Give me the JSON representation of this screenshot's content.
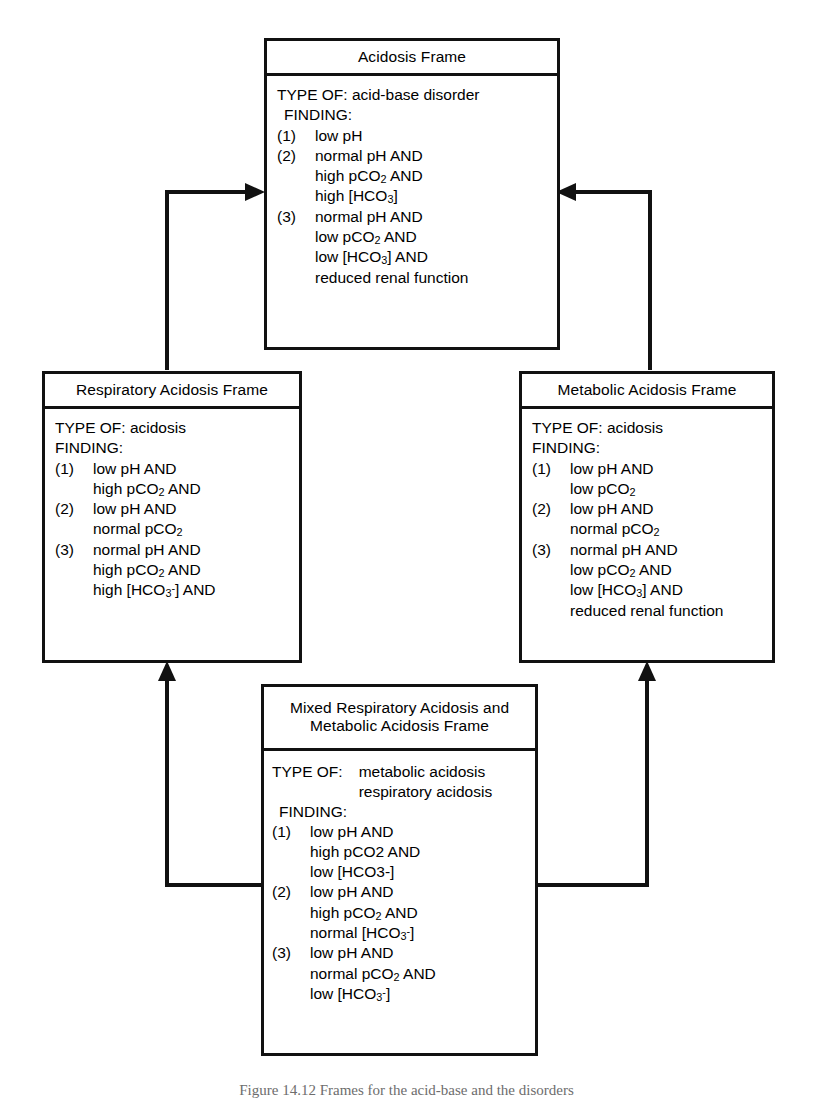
{
  "figure": {
    "caption": "Figure 14.12  Frames for the acid-base and the disorders"
  },
  "frames": {
    "acidosis": {
      "title": "Acidosis Frame",
      "type_of_label": "TYPE OF:",
      "type_of_value": "acid-base disorder",
      "finding_label": "FINDING:",
      "findings": [
        {
          "num": "(1)",
          "lines": [
            "low pH"
          ]
        },
        {
          "num": "(2)",
          "lines": [
            "normal pH AND",
            "high pCO₂ AND",
            "high [HCO₃]"
          ]
        },
        {
          "num": "(3)",
          "lines": [
            "normal pH AND",
            "low pCO₂ AND",
            "low [HCO₃] AND",
            "reduced renal function"
          ]
        }
      ]
    },
    "respiratory": {
      "title": "Respiratory Acidosis Frame",
      "type_of_label": "TYPE OF:",
      "type_of_value": "acidosis",
      "finding_label": "FINDING:",
      "findings": [
        {
          "num": "(1)",
          "lines": [
            "low pH AND",
            "high pCO₂ AND"
          ]
        },
        {
          "num": "(2)",
          "lines": [
            "low pH AND",
            "normal pCO₂"
          ]
        },
        {
          "num": "(3)",
          "lines": [
            "normal pH AND",
            "high pCO₂ AND",
            "high [HCO₃⁻] AND"
          ]
        }
      ]
    },
    "metabolic": {
      "title": "Metabolic Acidosis Frame",
      "type_of_label": "TYPE OF:",
      "type_of_value": "acidosis",
      "finding_label": "FINDING:",
      "findings": [
        {
          "num": "(1)",
          "lines": [
            "low pH AND",
            "low pCO₂"
          ]
        },
        {
          "num": "(2)",
          "lines": [
            "low pH AND",
            "normal pCO₂"
          ]
        },
        {
          "num": "(3)",
          "lines": [
            "normal pH AND",
            "low pCO₂ AND",
            "low [HCO₃] AND",
            "reduced renal function"
          ]
        }
      ]
    },
    "mixed": {
      "title_line1": "Mixed Respiratory Acidosis and",
      "title_line2": "Metabolic Acidosis Frame",
      "type_of_label": "TYPE OF:",
      "type_of_values": [
        "metabolic acidosis",
        "respiratory acidosis"
      ],
      "finding_label": "FINDING:",
      "findings": [
        {
          "num": "(1)",
          "lines": [
            "low pH AND",
            "high pCO2 AND",
            "low [HCO3-]"
          ]
        },
        {
          "num": "(2)",
          "lines": [
            "low pH AND",
            "high pCO₂ AND",
            "normal [HCO₃⁻]"
          ]
        },
        {
          "num": "(3)",
          "lines": [
            "low pH AND",
            "normal pCO₂ AND",
            "low [HCO₃⁻]"
          ]
        }
      ]
    }
  },
  "connectors": [
    {
      "name": "respiratory-to-acidosis",
      "direction": "right"
    },
    {
      "name": "metabolic-to-acidosis",
      "direction": "left"
    },
    {
      "name": "mixed-to-respiratory",
      "direction": "up"
    },
    {
      "name": "mixed-to-metabolic",
      "direction": "up"
    }
  ],
  "colors": {
    "line": "#111111",
    "background": "#ffffff",
    "text": "#000000"
  }
}
